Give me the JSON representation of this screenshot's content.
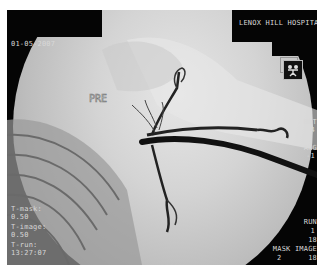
{
  "header": {
    "date": "01-05-2007",
    "institution": "LENOX HILL HOSPITAL"
  },
  "image": {
    "label_marker": "PRE",
    "description": "Digital subtraction angiogram of shoulder region showing contrast-filled vessels"
  },
  "left_panel": {
    "t_mask_label": "T-mask:",
    "t_mask_value": "0.50",
    "t_image_label": "T-image:",
    "t_image_value": "0.50",
    "t_run_label": "T-run:",
    "t_run_value": "13:27:07"
  },
  "right_panel": {
    "rot_label": "ROT",
    "rot_value": "4",
    "ang_label": "ANG",
    "ang_value": "-1",
    "run_label": "RUN",
    "run_value_1": "1",
    "run_value_2": "18",
    "mask_image_label": "MASK IMAGE",
    "mask_image_value_a": "2",
    "mask_image_value_b": "18"
  },
  "icons": {
    "orientation": "patient-orientation-icon"
  }
}
